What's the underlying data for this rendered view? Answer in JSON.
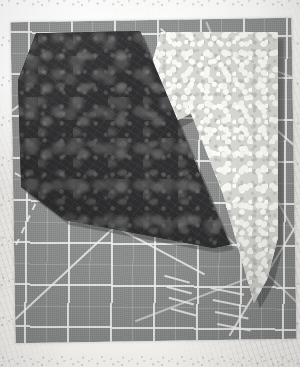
{
  "photo": {
    "title": "Two cut fabric pieces on a self-healing cutting mat",
    "width": 300,
    "height": 367,
    "scene_type": "quilting-fabric-layout-photo"
  },
  "backdrop": {
    "name": "mottled off-white surface",
    "color": "#f0efec"
  },
  "mat": {
    "label": "self-healing rotary cutting mat",
    "surface_color": "#8a8c8b",
    "grid_line_color": "#eeeeec",
    "grid_spacing_label": "1 inch grid",
    "half_grid_label": "half-inch grid",
    "guides": [
      {
        "name": "45-degree guide",
        "angle": 45
      },
      {
        "name": "60-degree guide",
        "angle": 60
      },
      {
        "name": "30-degree guide",
        "angle": 30
      },
      {
        "name": "dashed bias guide",
        "angle": 62
      }
    ],
    "tick_label": "ruler tick marks"
  },
  "fabrics": [
    {
      "id": "dark",
      "name": "dark batik fabric piece",
      "description": "mottled near-black print with gray highlights",
      "base_color": "#232325",
      "highlight_color": "#7a7c78",
      "shape": "irregular pentagon wedge",
      "position": "upper left"
    },
    {
      "id": "light",
      "name": "light floral print fabric piece",
      "description": "small scale cream and gray floral tossed print",
      "base_color": "#d4d4d0",
      "highlight_color": "#fafaf7",
      "shape": "tapering triangular wedge",
      "position": "right, narrowing to a point at lower right"
    }
  ],
  "colors": {
    "mat_gray": "#8a8c8b",
    "grid_white": "#eeeeec",
    "dark_fabric": "#232325",
    "light_fabric": "#d4d4d0",
    "paper_white": "#f0efec"
  }
}
